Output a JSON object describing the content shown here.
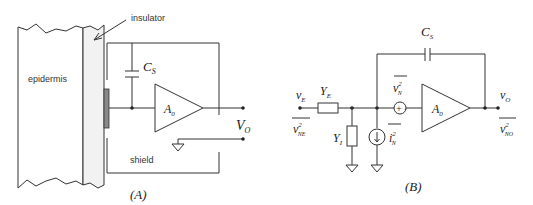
{
  "figure": {
    "panel_a": {
      "caption": "(A)",
      "labels": {
        "insulator": "insulator",
        "epidermis": "epidermis",
        "shield": "shield",
        "cs_main": "C",
        "cs_sub": "S",
        "amp_main": "A",
        "amp_sub": "0",
        "vo_main": "V",
        "vo_sub": "O"
      }
    },
    "panel_b": {
      "caption": "(B)",
      "labels": {
        "ve_main": "v",
        "ve_sub": "E",
        "ye_main": "Y",
        "ye_sub": "E",
        "yi_main": "Y",
        "yi_sub": "I",
        "vne_main": "v",
        "vne_sup": "2",
        "vne_sub": "NE",
        "vn_main": "v",
        "vn_sup": "2",
        "vn_sub": "N",
        "in_main": "i",
        "in_sup": "2",
        "in_sub": "N",
        "cs_main": "C",
        "cs_sub": "S",
        "amp_main": "A",
        "amp_sub": "0",
        "vo_main": "v",
        "vo_sub": "O",
        "vno_main": "v",
        "vno_sup": "2",
        "vno_sub": "NO"
      }
    }
  }
}
